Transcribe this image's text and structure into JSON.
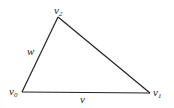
{
  "diagram": {
    "type": "triangle",
    "vertices": [
      {
        "id": "v0",
        "label": "v",
        "sub": "0"
      },
      {
        "id": "v1",
        "label": "v",
        "sub": "1"
      },
      {
        "id": "v2",
        "label": "v",
        "sub": "2"
      }
    ],
    "edges": [
      {
        "from": "v0",
        "to": "v1",
        "label": "v"
      },
      {
        "from": "v0",
        "to": "v2",
        "label": "w"
      },
      {
        "from": "v2",
        "to": "v1",
        "label": ""
      }
    ],
    "stroke_color": "#222222"
  }
}
